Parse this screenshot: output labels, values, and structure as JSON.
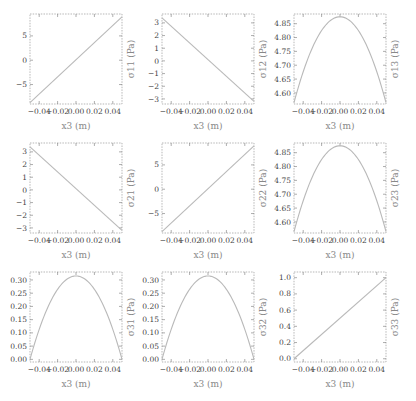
{
  "chart_data": [
    {
      "type": "line",
      "title": "",
      "xlabel": "x3 (m)",
      "ylabel": "σ11 (Pa)",
      "xlim": [
        -0.05,
        0.05
      ],
      "ylim": [
        -9,
        9.5
      ],
      "xticks": [
        -0.04,
        -0.02,
        0.0,
        0.02,
        0.04
      ],
      "xtick_labels": [
        "−0.04",
        "−0.02",
        "0.00",
        "0.02",
        "0.04"
      ],
      "yticks": [
        -5,
        0,
        5
      ],
      "ytick_labels": [
        "−5",
        "0",
        "5"
      ],
      "shape": "linear",
      "x": [
        -0.05,
        0.05
      ],
      "y": [
        -8.7,
        8.9
      ],
      "grid": false,
      "legend": null
    },
    {
      "type": "line",
      "title": "",
      "xlabel": "x3 (m)",
      "ylabel": "σ12 (Pa)",
      "xlim": [
        -0.05,
        0.05
      ],
      "ylim": [
        -3.4,
        3.7
      ],
      "xticks": [
        -0.04,
        -0.02,
        0.0,
        0.02,
        0.04
      ],
      "xtick_labels": [
        "−0.04",
        "−0.02",
        "0.00",
        "0.02",
        "0.04"
      ],
      "yticks": [
        -3,
        -2,
        -1,
        0,
        1,
        2,
        3
      ],
      "ytick_labels": [
        "−3",
        "−2",
        "−1",
        "0",
        "1",
        "2",
        "3"
      ],
      "shape": "linear",
      "x": [
        -0.05,
        0.05
      ],
      "y": [
        3.4,
        -3.2
      ],
      "grid": false,
      "legend": null
    },
    {
      "type": "line",
      "title": "",
      "xlabel": "x3 (m)",
      "ylabel": "σ13 (Pa)",
      "xlim": [
        -0.05,
        0.05
      ],
      "ylim": [
        4.56,
        4.885
      ],
      "xticks": [
        -0.04,
        -0.02,
        0.0,
        0.02,
        0.04
      ],
      "xtick_labels": [
        "−0.04",
        "−0.02",
        "0.00",
        "0.02",
        "0.04"
      ],
      "yticks": [
        4.6,
        4.65,
        4.7,
        4.75,
        4.8,
        4.85
      ],
      "ytick_labels": [
        "4.60",
        "4.65",
        "4.70",
        "4.75",
        "4.80",
        "4.85"
      ],
      "shape": "parabola",
      "x": [
        -0.05,
        0.0,
        0.05
      ],
      "y": [
        4.565,
        4.875,
        4.565
      ],
      "grid": false,
      "legend": null
    },
    {
      "type": "line",
      "title": "",
      "xlabel": "x3 (m)",
      "ylabel": "σ21 (Pa)",
      "xlim": [
        -0.05,
        0.05
      ],
      "ylim": [
        -3.4,
        3.7
      ],
      "xticks": [
        -0.04,
        -0.02,
        0.0,
        0.02,
        0.04
      ],
      "xtick_labels": [
        "−0.04",
        "−0.02",
        "0.00",
        "0.02",
        "0.04"
      ],
      "yticks": [
        -3,
        -2,
        -1,
        0,
        1,
        2,
        3
      ],
      "ytick_labels": [
        "−3",
        "−2",
        "−1",
        "0",
        "1",
        "2",
        "3"
      ],
      "shape": "linear",
      "x": [
        -0.05,
        0.05
      ],
      "y": [
        3.4,
        -3.2
      ],
      "grid": false,
      "legend": null
    },
    {
      "type": "line",
      "title": "",
      "xlabel": "x3 (m)",
      "ylabel": "σ22 (Pa)",
      "xlim": [
        -0.05,
        0.05
      ],
      "ylim": [
        -9,
        9.5
      ],
      "xticks": [
        -0.04,
        -0.02,
        0.0,
        0.02,
        0.04
      ],
      "xtick_labels": [
        "−0.04",
        "−0.02",
        "0.00",
        "0.02",
        "0.04"
      ],
      "yticks": [
        -5,
        0,
        5
      ],
      "ytick_labels": [
        "−5",
        "0",
        "5"
      ],
      "shape": "linear",
      "x": [
        -0.05,
        0.05
      ],
      "y": [
        -8.7,
        8.9
      ],
      "grid": false,
      "legend": null
    },
    {
      "type": "line",
      "title": "",
      "xlabel": "x3 (m)",
      "ylabel": "σ23 (Pa)",
      "xlim": [
        -0.05,
        0.05
      ],
      "ylim": [
        4.56,
        4.885
      ],
      "xticks": [
        -0.04,
        -0.02,
        0.0,
        0.02,
        0.04
      ],
      "xtick_labels": [
        "−0.04",
        "−0.02",
        "0.00",
        "0.02",
        "0.04"
      ],
      "yticks": [
        4.6,
        4.65,
        4.7,
        4.75,
        4.8,
        4.85
      ],
      "ytick_labels": [
        "4.60",
        "4.65",
        "4.70",
        "4.75",
        "4.80",
        "4.85"
      ],
      "shape": "parabola",
      "x": [
        -0.05,
        0.0,
        0.05
      ],
      "y": [
        4.565,
        4.875,
        4.565
      ],
      "grid": false,
      "legend": null
    },
    {
      "type": "line",
      "title": "",
      "xlabel": "x3 (m)",
      "ylabel": "σ31 (Pa)",
      "xlim": [
        -0.05,
        0.05
      ],
      "ylim": [
        -0.01,
        0.33
      ],
      "xticks": [
        -0.04,
        -0.02,
        0.0,
        0.02,
        0.04
      ],
      "xtick_labels": [
        "−0.04",
        "−0.02",
        "0.00",
        "0.02",
        "0.04"
      ],
      "yticks": [
        0.0,
        0.05,
        0.1,
        0.15,
        0.2,
        0.25,
        0.3
      ],
      "ytick_labels": [
        "0.00",
        "0.05",
        "0.10",
        "0.15",
        "0.20",
        "0.25",
        "0.30"
      ],
      "shape": "parabola",
      "x": [
        -0.05,
        0.0,
        0.05
      ],
      "y": [
        0.0,
        0.315,
        0.0
      ],
      "grid": false,
      "legend": null
    },
    {
      "type": "line",
      "title": "",
      "xlabel": "x3 (m)",
      "ylabel": "σ32 (Pa)",
      "xlim": [
        -0.05,
        0.05
      ],
      "ylim": [
        -0.01,
        0.33
      ],
      "xticks": [
        -0.04,
        -0.02,
        0.0,
        0.02,
        0.04
      ],
      "xtick_labels": [
        "−0.04",
        "−0.02",
        "0.00",
        "0.02",
        "0.04"
      ],
      "yticks": [
        0.0,
        0.05,
        0.1,
        0.15,
        0.2,
        0.25,
        0.3
      ],
      "ytick_labels": [
        "0.00",
        "0.05",
        "0.10",
        "0.15",
        "0.20",
        "0.25",
        "0.30"
      ],
      "shape": "parabola",
      "x": [
        -0.05,
        0.0,
        0.05
      ],
      "y": [
        0.0,
        0.315,
        0.0
      ],
      "grid": false,
      "legend": null
    },
    {
      "type": "line",
      "title": "",
      "xlabel": "x3 (m)",
      "ylabel": "σ33 (Pa)",
      "xlim": [
        -0.05,
        0.05
      ],
      "ylim": [
        -0.04,
        1.07
      ],
      "xticks": [
        -0.04,
        -0.02,
        0.0,
        0.02,
        0.04
      ],
      "xtick_labels": [
        "−0.04",
        "−0.02",
        "0.00",
        "0.02",
        "0.04"
      ],
      "yticks": [
        0.0,
        0.2,
        0.4,
        0.6,
        0.8,
        1.0
      ],
      "ytick_labels": [
        "0.0",
        "0.2",
        "0.4",
        "0.6",
        "0.8",
        "1.0"
      ],
      "shape": "linear",
      "x": [
        -0.05,
        0.05
      ],
      "y": [
        0.0,
        1.0
      ],
      "grid": false,
      "legend": null
    }
  ],
  "layout": {
    "columns_x": [
      30,
      162,
      294
    ],
    "rows_y": [
      14,
      143,
      272
    ],
    "frame_width": 92,
    "frame_height": 90
  }
}
